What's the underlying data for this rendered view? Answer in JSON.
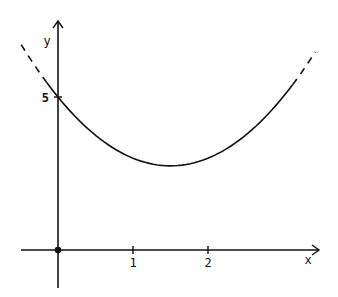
{
  "chart_data": {
    "type": "line",
    "title": "",
    "xlabel": "x",
    "ylabel": "y",
    "x_ticks": [
      "1",
      "2"
    ],
    "y_ticks": [
      "5"
    ],
    "xlim": [
      -0.75,
      3.5
    ],
    "ylim": [
      -1.5,
      7.5
    ],
    "grid": false,
    "legend": null,
    "function": "y = x^2 - 3x + 5",
    "series": [
      {
        "name": "parabola",
        "style": "solid",
        "x": [
          -0.15,
          0,
          0.5,
          1,
          1.5,
          2,
          2.5,
          3,
          3.13
        ],
        "y": [
          5.47,
          5,
          3.75,
          3,
          2.75,
          3,
          3.75,
          5,
          5.41
        ]
      },
      {
        "name": "left-extension",
        "style": "dashed",
        "x": [
          -0.49,
          -0.15
        ],
        "y": [
          6.71,
          5.47
        ]
      },
      {
        "name": "right-extension",
        "style": "dashed",
        "x": [
          3.13,
          3.43
        ],
        "y": [
          5.41,
          6.47
        ]
      }
    ],
    "annotations": [
      {
        "type": "point",
        "x": 0,
        "y": 0,
        "label": "origin"
      },
      {
        "type": "y-intercept",
        "x": 0,
        "y": 5,
        "label": "5"
      }
    ]
  },
  "labels": {
    "x_axis": "x",
    "y_axis": "y",
    "tick_1": "1",
    "tick_2": "2",
    "tick_5": "5"
  },
  "colors": {
    "line": "#111111",
    "background": "#ffffff"
  }
}
